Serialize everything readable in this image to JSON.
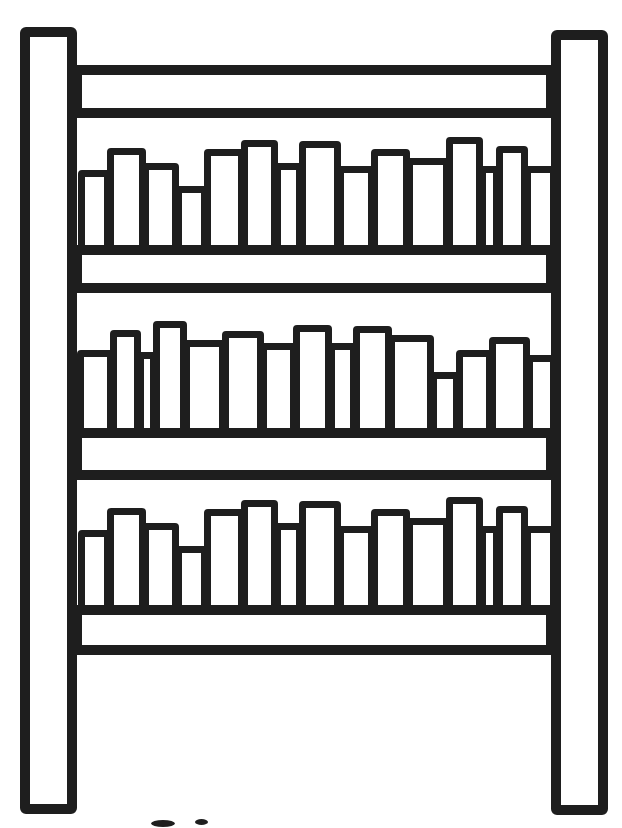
{
  "illustration": {
    "alt": "Black and white line drawing of a bookshelf: two tall side posts, four cross boards, and three shelves filled with upright books of varying heights",
    "background_color": "#ffffff",
    "line_color": "#1e1e1e",
    "canvas": {
      "width": 622,
      "height": 828
    },
    "frame": {
      "stroke": 10,
      "posts": [
        {
          "name": "shelf-post-left",
          "x": 20,
          "y": 27,
          "w": 57,
          "h": 787
        },
        {
          "name": "shelf-post-right",
          "x": 551,
          "y": 30,
          "w": 57,
          "h": 785
        }
      ],
      "boards": [
        {
          "name": "top-board",
          "x": 72,
          "y": 65,
          "w": 484,
          "h": 53
        },
        {
          "name": "shelf-board-1",
          "x": 72,
          "y": 245,
          "w": 484,
          "h": 48
        },
        {
          "name": "shelf-board-2",
          "x": 72,
          "y": 428,
          "w": 484,
          "h": 52
        },
        {
          "name": "shelf-board-3",
          "x": 72,
          "y": 605,
          "w": 484,
          "h": 50
        }
      ]
    },
    "book_stroke": 7,
    "book_overlap": 8,
    "shelves": [
      {
        "name": "top-shelf",
        "baseline": 245,
        "books": [
          {
            "x": 78,
            "w": 33,
            "top": 170
          },
          {
            "x": 107,
            "w": 39,
            "top": 148
          },
          {
            "x": 142,
            "w": 37,
            "top": 163
          },
          {
            "x": 175,
            "w": 33,
            "top": 186
          },
          {
            "x": 204,
            "w": 41,
            "top": 149
          },
          {
            "x": 241,
            "w": 37,
            "top": 140
          },
          {
            "x": 274,
            "w": 29,
            "top": 163
          },
          {
            "x": 299,
            "w": 42,
            "top": 141
          },
          {
            "x": 337,
            "w": 38,
            "top": 166
          },
          {
            "x": 371,
            "w": 39,
            "top": 149
          },
          {
            "x": 406,
            "w": 44,
            "top": 158
          },
          {
            "x": 446,
            "w": 37,
            "top": 137
          },
          {
            "x": 479,
            "w": 21,
            "top": 166
          },
          {
            "x": 496,
            "w": 32,
            "top": 146
          },
          {
            "x": 524,
            "w": 33,
            "top": 166
          }
        ]
      },
      {
        "name": "middle-shelf",
        "baseline": 428,
        "books": [
          {
            "x": 77,
            "w": 37,
            "top": 350
          },
          {
            "x": 110,
            "w": 31,
            "top": 330
          },
          {
            "x": 137,
            "w": 20,
            "top": 352
          },
          {
            "x": 153,
            "w": 34,
            "top": 321
          },
          {
            "x": 183,
            "w": 43,
            "top": 340
          },
          {
            "x": 222,
            "w": 42,
            "top": 331
          },
          {
            "x": 260,
            "w": 37,
            "top": 343
          },
          {
            "x": 293,
            "w": 39,
            "top": 325
          },
          {
            "x": 328,
            "w": 29,
            "top": 343
          },
          {
            "x": 353,
            "w": 39,
            "top": 326
          },
          {
            "x": 388,
            "w": 46,
            "top": 335
          },
          {
            "x": 430,
            "w": 30,
            "top": 372
          },
          {
            "x": 456,
            "w": 37,
            "top": 350
          },
          {
            "x": 489,
            "w": 41,
            "top": 337
          },
          {
            "x": 526,
            "w": 31,
            "top": 355
          }
        ]
      },
      {
        "name": "bottom-shelf",
        "baseline": 605,
        "books": [
          {
            "x": 78,
            "w": 33,
            "top": 530
          },
          {
            "x": 107,
            "w": 39,
            "top": 508
          },
          {
            "x": 142,
            "w": 37,
            "top": 523
          },
          {
            "x": 175,
            "w": 33,
            "top": 546
          },
          {
            "x": 204,
            "w": 41,
            "top": 509
          },
          {
            "x": 241,
            "w": 37,
            "top": 500
          },
          {
            "x": 274,
            "w": 29,
            "top": 523
          },
          {
            "x": 299,
            "w": 42,
            "top": 501
          },
          {
            "x": 337,
            "w": 38,
            "top": 526
          },
          {
            "x": 371,
            "w": 39,
            "top": 509
          },
          {
            "x": 406,
            "w": 44,
            "top": 518
          },
          {
            "x": 446,
            "w": 37,
            "top": 497
          },
          {
            "x": 479,
            "w": 21,
            "top": 526
          },
          {
            "x": 496,
            "w": 32,
            "top": 506
          },
          {
            "x": 524,
            "w": 33,
            "top": 526
          }
        ]
      }
    ],
    "artifacts": [
      {
        "name": "cut-off-mark-1",
        "x": 151,
        "y": 820,
        "w": 24,
        "h": 7
      },
      {
        "name": "cut-off-mark-2",
        "x": 195,
        "y": 819,
        "w": 13,
        "h": 6
      }
    ]
  }
}
